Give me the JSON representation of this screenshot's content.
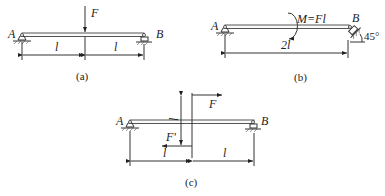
{
  "figures": [
    {
      "id": "a",
      "caption": "(a)",
      "labels": {
        "left_support": "A",
        "right_support": "B",
        "force": "F",
        "span_left": "l",
        "span_right": "l"
      }
    },
    {
      "id": "b",
      "caption": "(b)",
      "labels": {
        "left_support": "A",
        "right_support": "B",
        "moment": "M=Fl",
        "span": "2l",
        "angle": "45°"
      }
    },
    {
      "id": "c",
      "caption": "(c)",
      "labels": {
        "left_support": "A",
        "right_support": "B",
        "force_top": "F",
        "force_bottom": "F'",
        "arm": "l",
        "span_left": "l",
        "span_right": "l"
      }
    }
  ]
}
